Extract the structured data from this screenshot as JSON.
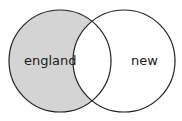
{
  "diagram": {
    "type": "venn",
    "sets": [
      {
        "label": "england",
        "shaded": true
      },
      {
        "label": "new",
        "shaded": false
      }
    ],
    "colors": {
      "shade": "#d4d4d4",
      "stroke": "#222222",
      "background": "#ffffff"
    }
  }
}
